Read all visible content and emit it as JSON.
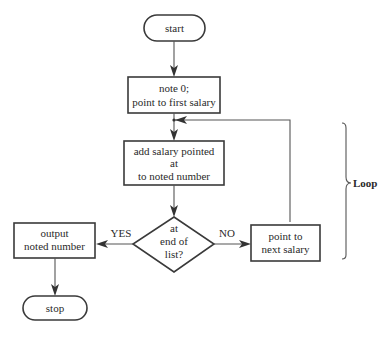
{
  "diagram": {
    "type": "flowchart",
    "nodes": {
      "start": {
        "shape": "terminal",
        "label": "start"
      },
      "init": {
        "shape": "process",
        "line1": "note 0;",
        "line2": "point to first salary"
      },
      "add": {
        "shape": "process",
        "line1": "add  salary  pointed",
        "line2": "at",
        "line3": "to noted number"
      },
      "decision": {
        "shape": "decision",
        "line1": "at",
        "line2": "end of",
        "line3": "list?"
      },
      "output": {
        "shape": "process",
        "line1": "output",
        "line2": "noted number"
      },
      "next": {
        "shape": "process",
        "line1": "point to",
        "line2": "next salary"
      },
      "stop": {
        "shape": "terminal",
        "label": "stop"
      }
    },
    "edges": {
      "yes_label": "YES",
      "no_label": "NO"
    },
    "annotation": {
      "brace_label": "Loop"
    },
    "colors": {
      "stroke": "#3a3a3a",
      "text": "#2a2a2a",
      "background": "#ffffff"
    }
  }
}
